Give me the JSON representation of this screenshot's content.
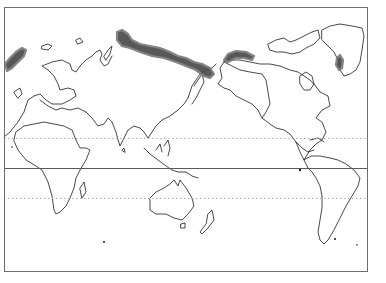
{
  "map": {
    "type": "world-map",
    "projection": "equirectangular, Pacific-centered (Greenwich near left edge)",
    "frame": {
      "x": 4,
      "y": 7,
      "width": 363,
      "height": 264,
      "stroke": "#6e6e6e"
    },
    "reference_lines": {
      "equator": {
        "y": 168,
        "style": "solid",
        "color": "#5a5a5a"
      },
      "tropic_of_cancer": {
        "y": 138,
        "style": "dotted",
        "color": "#b0b0b0"
      },
      "tropic_of_capricorn": {
        "y": 198,
        "style": "dotted",
        "color": "#b0b0b0"
      }
    },
    "colors": {
      "coastline": "#1a1a1a",
      "shaded_region": "#4a4a4a",
      "background": "#ffffff"
    },
    "shaded_regions": [
      {
        "name": "east-greenland-sea-region",
        "path": "M5,64 L10,58 L16,52 L22,48 L26,50 L24,56 L18,62 L12,68 L7,71 Z"
      },
      {
        "name": "siberia-arctic-coast",
        "path": "M117,32 L122,30 L128,34 L132,40 L140,44 L150,46 L160,48 L170,52 L178,56 L186,58 L194,62 L202,64 L210,68 L214,74 L210,78 L204,76 L196,70 L186,66 L176,62 L164,58 L152,56 L140,52 L130,48 L122,46 L117,40 Z"
      },
      {
        "name": "alaska-arctic-coast",
        "path": "M224,60 L228,54 L236,51 L246,52 L254,56 L252,60 L244,58 L236,58 L228,62 Z"
      },
      {
        "name": "greenland-east-coast",
        "path": "M337,58 L340,55 L343,60 L342,68 L339,70 L336,65 Z"
      }
    ],
    "coastlines": [
      {
        "name": "scandinavia-europe",
        "path": "M4,137 L10,132 L18,122 L24,112 L28,100 L34,96 L40,94 L46,100 L52,104 L62,104 L70,100 L76,96 L74,90 L68,88 L60,90 L58,84 L54,76 L48,70 L42,66 L52,62 L62,60 L70,64 L72,70 L76,72 L80,66 L86,60 L92,56 L96,52 L100,50 L102,54 L100,60 L104,66 L108,64 L112,56"
      },
      {
        "name": "africa",
        "path": "M14,141 L18,150 L26,160 L36,166 L42,170 L48,182 L52,196 L54,210 L56,214 L60,212 L66,206 L70,198 L74,188 L76,178 L80,170 L86,160 L90,150 L86,148 L80,148 L76,140 L72,130 L64,126 L54,124 L44,122 L34,124 L24,126 L16,132 Z"
      },
      {
        "name": "arabia-india-asia",
        "path": "M86,112 L92,118 L98,126 L104,124 L108,118 L112,122 L116,132 L118,140 L120,146 L124,138 L128,130 L134,126 L140,128 L144,132 L148,138 L152,132 L156,126 L162,120 L170,116 L178,110 L184,104 L188,98 L190,92 L192,86 L196,80 L200,74 L206,70 L212,68 L216,64"
      },
      {
        "name": "mediterranean",
        "path": "M40,100 L48,106 L56,110 L62,108 L70,110 L78,108 L86,112"
      },
      {
        "name": "madagascar",
        "path": "M80,188 L84,182 L86,192 L82,198 Z"
      },
      {
        "name": "sri-lanka",
        "path": "M122,150 L124,148 L125,152 Z"
      },
      {
        "name": "japan",
        "path": "M194,86 L198,80 L202,74 L204,82 L200,90 L196,98 L192,104"
      },
      {
        "name": "southeast-asia-islands",
        "path": "M144,148 L150,154 L158,160 L166,166 L172,170 L178,172 L186,172 L192,176 L198,178 M156,150 L160,144 L162,152 M164,146 L168,140 L170,148 L168,156"
      },
      {
        "name": "australia",
        "path": "M150,198 L156,192 L164,188 L170,184 L174,180 L178,186 L180,180 L186,188 L192,198 L194,206 L188,214 L182,220 L174,218 L166,214 L156,214 L150,210 L150,202 Z"
      },
      {
        "name": "tasmania",
        "path": "M181,224 L185,223 L185,228 L181,228 Z"
      },
      {
        "name": "new-zealand",
        "path": "M208,214 L212,210 L214,220 L208,228 L202,234 L200,232 L206,224 Z"
      },
      {
        "name": "north-america",
        "path": "M224,62 L232,66 L240,70 L250,72 L262,74 L266,80 L268,92 L270,104 L266,112 L262,118 L270,124 L276,128 L284,130 L290,134 L296,142 L300,152 L304,160 L310,150 L316,144 L322,140 L326,132 L322,122 L316,118 L322,110 L330,106 L328,96 L320,92 L314,84 L310,80 L304,76 L298,72 L290,70 L280,66 L270,64 L260,64 L250,62 L240,60 L230,60 Z"
      },
      {
        "name": "alaska",
        "path": "M224,62 L220,68 L222,78 L218,84 L224,88 L230,90 L236,96 L244,100 L252,104 L258,110 L262,118"
      },
      {
        "name": "canadian-archipelago",
        "path": "M268,44 L276,40 L284,38 L290,42 L296,40 L304,36 L312,32 L318,30 L320,38 L314,44 L306,48 L300,52 L292,54 L284,52 L276,52 L270,50 Z"
      },
      {
        "name": "greenland",
        "path": "M322,30 L330,26 L340,24 L352,26 L362,28 L364,36 L362,50 L360,62 L356,70 L350,74 L344,76 L340,70 L338,60 L334,52 L328,46 L322,40 Z"
      },
      {
        "name": "hudson-bay",
        "path": "M300,76 L306,72 L312,76 L314,84 L310,90 L304,90 L300,84 Z"
      },
      {
        "name": "central-america-caribbean",
        "path": "M296,142 L302,148 L308,152 L314,150 M310,140 L318,138 L324,142"
      },
      {
        "name": "south-america",
        "path": "M304,160 L308,168 L312,172 L316,178 L320,186 L322,196 L322,208 L320,220 L318,232 L320,240 L324,244 L328,240 L334,230 L340,218 L346,206 L352,196 L358,186 L360,178 L354,170 L346,164 L338,160 L330,158 L320,156 L312,156 Z"
      },
      {
        "name": "british-isles",
        "path": "M14,92 L20,88 L22,94 L18,98 Z"
      },
      {
        "name": "iceland",
        "path": "M42,46 L48,44 L52,46 L48,50 L42,49 Z"
      },
      {
        "name": "svalbard",
        "path": "M76,40 L80,38 L83,42 L78,44 Z"
      },
      {
        "name": "novaya-zemlya",
        "path": "M104,56 L108,50 L112,46 L110,54 L106,60 Z"
      }
    ],
    "dots": [
      {
        "name": "island-south-indian-ocean",
        "cx": 104,
        "cy": 242,
        "r": 1
      },
      {
        "name": "island-galapagos",
        "cx": 300,
        "cy": 170,
        "r": 1.2
      },
      {
        "name": "island-falklands",
        "cx": 335,
        "cy": 239,
        "r": 1
      },
      {
        "name": "island-south-georgia",
        "cx": 357,
        "cy": 245,
        "r": 0.8
      },
      {
        "name": "island-azores",
        "cx": 12,
        "cy": 147,
        "r": 0.8
      }
    ]
  }
}
